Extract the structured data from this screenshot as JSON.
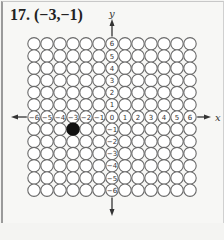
{
  "problem": {
    "number_label": "17.",
    "point_label": "(−3,−1)"
  },
  "axes": {
    "x_label": "x",
    "y_label": "y",
    "x_ticks": [
      "-6",
      "-5",
      "-4",
      "-3",
      "-2",
      "-1",
      "0",
      "1",
      "2",
      "3",
      "4",
      "5",
      "6"
    ],
    "y_ticks": [
      "6",
      "5",
      "4",
      "3",
      "2",
      "1",
      "0",
      "-1",
      "-2",
      "-3",
      "-4",
      "-5",
      "-6"
    ],
    "x_range": [
      -6,
      6
    ],
    "y_range": [
      -6,
      6
    ]
  },
  "plotted_point": {
    "x": -3,
    "y": -1,
    "color": "#111111"
  },
  "colors": {
    "circle_stroke": "#6a6a6a",
    "circle_fill": "#ffffff",
    "text": "#333333",
    "axis": "#333333"
  }
}
